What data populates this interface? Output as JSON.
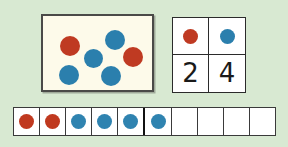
{
  "page": {
    "background_color": "#d8e9d2"
  },
  "colors": {
    "red": "#bf3a22",
    "blue": "#2b7fad",
    "card_background": "#fdfaea",
    "card_border": "#4a4a48",
    "cell_border": "#2b2b2b",
    "page_background": "#d8e9d2"
  },
  "dot_card": {
    "name": "scattered dot card",
    "total_dots": 6,
    "red_count": 2,
    "blue_count": 4,
    "dots": [
      {
        "color": "red",
        "x": 17,
        "y": 20,
        "d": 20
      },
      {
        "color": "blue",
        "x": 41,
        "y": 33,
        "d": 19
      },
      {
        "color": "blue",
        "x": 62,
        "y": 14,
        "d": 20
      },
      {
        "color": "red",
        "x": 80,
        "y": 31,
        "d": 20
      },
      {
        "color": "blue",
        "x": 16,
        "y": 49,
        "d": 20
      },
      {
        "color": "blue",
        "x": 58,
        "y": 50,
        "d": 20
      }
    ]
  },
  "key_grid": {
    "name": "color count key",
    "columns": [
      {
        "icon": "red-dot-icon",
        "color": "red",
        "count": "2"
      },
      {
        "icon": "blue-dot-icon",
        "color": "blue",
        "count": "4"
      }
    ]
  },
  "ten_frame": {
    "name": "ten frame counting strip",
    "cell_count": 10,
    "filled_count": 6,
    "empty_count": 4,
    "midpoint_after_cell": 5,
    "cells": [
      {
        "index": 1,
        "fill": "red",
        "filled": true
      },
      {
        "index": 2,
        "fill": "red",
        "filled": true
      },
      {
        "index": 3,
        "fill": "blue",
        "filled": true
      },
      {
        "index": 4,
        "fill": "blue",
        "filled": true
      },
      {
        "index": 5,
        "fill": "blue",
        "filled": true
      },
      {
        "index": 6,
        "fill": "blue",
        "filled": true
      },
      {
        "index": 7,
        "fill": "empty",
        "filled": false
      },
      {
        "index": 8,
        "fill": "empty",
        "filled": false
      },
      {
        "index": 9,
        "fill": "empty",
        "filled": false
      },
      {
        "index": 10,
        "fill": "empty",
        "filled": false
      }
    ]
  }
}
